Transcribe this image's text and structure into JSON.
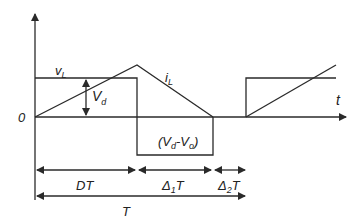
{
  "diagram": {
    "type": "waveform-timing-diagram",
    "colors": {
      "line": "#2a2a2a",
      "background": "#ffffff"
    },
    "axes": {
      "origin_label": "0",
      "x_label": "t"
    },
    "waveforms": {
      "voltage": {
        "label_main": "v",
        "label_sub": "L",
        "description": "inductor voltage: +Vd during DT, -(Vd-Vo) during Δ1T, 0 during Δ2T"
      },
      "current": {
        "label_main": "i",
        "label_sub": "L",
        "description": "inductor current: rises during DT, falls to zero during Δ1T, zero during Δ2T"
      }
    },
    "annotations": {
      "vd": {
        "main": "V",
        "sub": "d"
      },
      "neg": {
        "open": "(V",
        "sub1": "d",
        "mid": "-V",
        "sub2": "o",
        "close": ")"
      }
    },
    "intervals": [
      {
        "main": "DT",
        "sub": "",
        "tail": ""
      },
      {
        "main": "Δ",
        "sub": "1",
        "tail": "T"
      },
      {
        "main": "Δ",
        "sub": "2",
        "tail": "T"
      }
    ],
    "period": {
      "label": "T"
    }
  }
}
